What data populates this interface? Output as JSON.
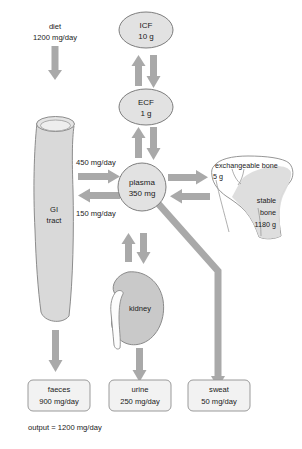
{
  "diagram": {
    "colors": {
      "arrow": "#a9a9a9",
      "organ_fill": "#d4d4d4",
      "organ_stroke": "#8a8a8a",
      "node_fill": "#e0e0e0",
      "node_stroke": "#808080",
      "box_fill": "#f0f0f0",
      "box_stroke": "#9a9a9a",
      "bone_fill": "#ffffff",
      "bone_stroke": "#8a8a8a",
      "stable_bone_fill": "#dcdcdc",
      "text": "#1a1a1a"
    },
    "input": {
      "name": "diet",
      "label_line1": "diet",
      "label_line2": "1200 mg/day"
    },
    "organs": {
      "gi_tract": {
        "label_line1": "GI",
        "label_line2": "tract"
      },
      "kidney": {
        "label": "kidney"
      }
    },
    "compartments": [
      {
        "id": "icf",
        "label": "ICF",
        "value": "10 g"
      },
      {
        "id": "ecf",
        "label": "ECF",
        "value": "1 g"
      },
      {
        "id": "plasma",
        "label": "plasma",
        "value": "350 mg"
      }
    ],
    "bone": {
      "exchangeable_label": "exchangeable bone",
      "exchangeable_value": "5 g",
      "stable_label_line1": "stable",
      "stable_label_line2": "bone",
      "stable_value": "1180 g"
    },
    "flows": {
      "absorption": "450 mg/day",
      "secretion": "150 mg/day"
    },
    "outputs": [
      {
        "id": "faeces",
        "label": "faeces",
        "value": "900 mg/day"
      },
      {
        "id": "urine",
        "label": "urine",
        "value": "250 mg/day"
      },
      {
        "id": "sweat",
        "label": "sweat",
        "value": "50 mg/day"
      }
    ],
    "summary": "output = 1200 mg/day"
  }
}
